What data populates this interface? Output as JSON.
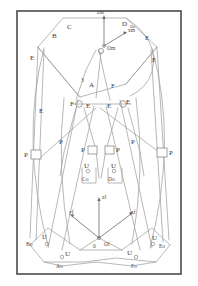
{
  "figure": {
    "border_color": "#444444",
    "line_color": "#9a9a9a",
    "line_color_dark": "#7a7a7a",
    "text_color": "#3a3a3a",
    "background": "#ffffff",
    "width": 198,
    "height": 286
  },
  "frames": {
    "moving": {
      "origin_label": "Om",
      "axis_z_label": "zm",
      "axis_x_label": "xm"
    },
    "fixed": {
      "origin_label": "Of",
      "zero_label": "0",
      "axis_z_label": "zf",
      "axis_x_label": "xf",
      "axis_y_label": "yf"
    }
  },
  "platform_vertices": [
    {
      "name": "A",
      "label": "A"
    },
    {
      "name": "B",
      "label": "B"
    },
    {
      "name": "C",
      "label": "C"
    },
    {
      "name": "D",
      "label": "D"
    },
    {
      "name": "E",
      "label": "E"
    },
    {
      "name": "F",
      "label": "F"
    }
  ],
  "base_vertices": [
    {
      "name": "Ao",
      "label": "Ao"
    },
    {
      "name": "Bo",
      "label": "Bo"
    },
    {
      "name": "Co",
      "label": "Co"
    },
    {
      "name": "Do",
      "label": "Do"
    },
    {
      "name": "Eo",
      "label": "Eo"
    },
    {
      "name": "Fo",
      "label": "Fo"
    }
  ],
  "joint_labels": {
    "revolute": "E",
    "fixed": "F",
    "prismatic": "P",
    "universal": "U",
    "cylindrical": "C"
  },
  "annotations": {
    "leg_number": "3",
    "platform_top_C": "C",
    "platform_top_B": "B",
    "platform_top_D": "D",
    "platform_right_E1": "E",
    "platform_right_E2": "E",
    "platform_left_E": "E",
    "center_F_left": "F",
    "center_F_right": "F",
    "center_E_a": "E",
    "center_E_b": "E",
    "center_E_c": "E",
    "center_E_d": "E",
    "center_A": "A",
    "prismatic_left_outer": "P",
    "prismatic_left_inner": "P",
    "prismatic_right_inner": "P",
    "prismatic_right_outer": "P",
    "universal_mid_left": "U",
    "universal_mid_right": "U",
    "universal_base_left_top": "U",
    "universal_base_left_bot": "U",
    "universal_base_right_top": "U",
    "universal_base_right_bot": "U"
  }
}
